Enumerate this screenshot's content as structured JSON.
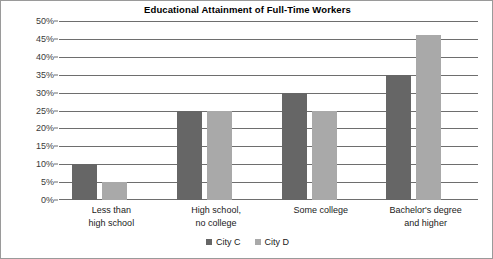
{
  "chart_data": {
    "type": "bar",
    "title": "Educational Attainment of Full-Time Workers",
    "xlabel": "",
    "ylabel": "",
    "categories": [
      "Less than high school",
      "High school, no college",
      "Some college",
      "Bachelor's degree and higher"
    ],
    "category_lines": [
      [
        "Less than",
        "high school"
      ],
      [
        "High school,",
        "no college"
      ],
      [
        "Some college"
      ],
      [
        "Bachelor's degree",
        "and higher"
      ]
    ],
    "series": [
      {
        "name": "City C",
        "color": "#666666",
        "values": [
          10,
          25,
          30,
          35
        ]
      },
      {
        "name": "City D",
        "color": "#a9a9a9",
        "values": [
          5,
          25,
          25,
          46
        ]
      }
    ],
    "ylim": [
      0,
      50
    ],
    "ytick_step": 5,
    "ytick_labels": [
      "50%",
      "45%",
      "40%",
      "35%",
      "30%",
      "25%",
      "20%",
      "15%",
      "10%",
      "5%",
      "0%"
    ],
    "ytick_values": [
      50,
      45,
      40,
      35,
      30,
      25,
      20,
      15,
      10,
      5,
      0
    ],
    "grid": true,
    "legend_position": "bottom",
    "value_suffix": "%"
  },
  "legend": {
    "items": [
      {
        "label": "City C",
        "color": "#666666"
      },
      {
        "label": "City D",
        "color": "#a9a9a9"
      }
    ]
  }
}
